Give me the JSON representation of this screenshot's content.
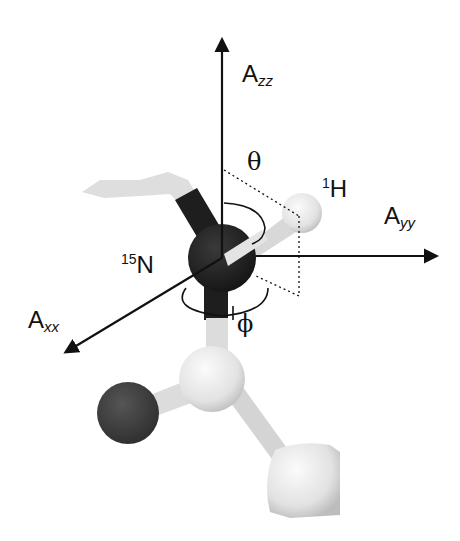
{
  "figure": {
    "axes": {
      "zz": {
        "main": "A",
        "sub": "zz"
      },
      "yy": {
        "main": "A",
        "sub": "yy"
      },
      "xx": {
        "main": "A",
        "sub": "xx"
      }
    },
    "atoms": {
      "hydrogen": {
        "sup": "1",
        "symbol": "H"
      },
      "nitrogen": {
        "sup": "15",
        "symbol": "N"
      }
    },
    "angles": {
      "theta": "θ",
      "phi": "ϕ"
    },
    "colors": {
      "background": "#ffffff",
      "axis": "#111111",
      "dark_atom": "#1e1e1e",
      "oxygen_atom": "#3a3a3a",
      "light_atom": "#e6e6e6",
      "bond_light": "#d9d9d9"
    }
  }
}
